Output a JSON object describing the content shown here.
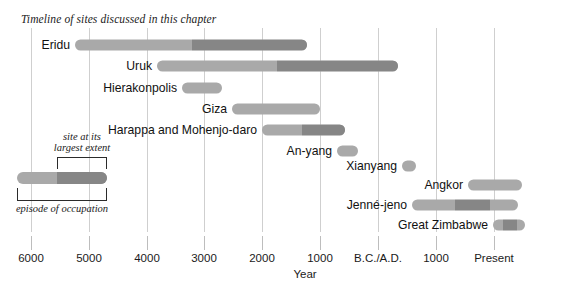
{
  "title": "Timeline of sites discussed in this chapter",
  "axis": {
    "label": "Year",
    "ticks": [
      {
        "text": "6000",
        "x": 31
      },
      {
        "text": "5000",
        "x": 89
      },
      {
        "text": "4000",
        "x": 147
      },
      {
        "text": "3000",
        "x": 204
      },
      {
        "text": "2000",
        "x": 262
      },
      {
        "text": "1000",
        "x": 320
      },
      {
        "text": "B.C./A.D.",
        "x": 378
      },
      {
        "text": "1000",
        "x": 436
      },
      {
        "text": "Present",
        "x": 494
      }
    ]
  },
  "colors": {
    "occupation": "#a9a9a9",
    "largest_extent": "#868686",
    "gridline": "#cfcfcf",
    "tick": "#bdbdbd",
    "text": "#111111",
    "bracket": "#2b2b2b"
  },
  "legend": {
    "upper_label_line1": "site at its",
    "upper_label_line2": "largest extent",
    "lower_label": "episode of occupation"
  },
  "chart_data": {
    "type": "bar",
    "orientation": "horizontal",
    "title": "Timeline of sites discussed in this chapter",
    "xlabel": "Year",
    "ylabel": "",
    "grid": true,
    "legend_position": "inside-left",
    "x_axis_ticks": [
      "6000",
      "5000",
      "4000",
      "3000",
      "2000",
      "1000",
      "B.C./A.D.",
      "1000",
      "Present"
    ],
    "x_axis_note": "Years B.C. decreasing left to right, then A.D. increasing to Present",
    "series_legend": [
      {
        "name": "episode of occupation",
        "color": "#a9a9a9"
      },
      {
        "name": "site at its largest extent",
        "color": "#868686"
      }
    ],
    "categories": [
      "Eridu",
      "Uruk",
      "Hierakonpolis",
      "Giza",
      "Harappa and Mohenjo-daro",
      "An-yang",
      "Xianyang",
      "Angkor",
      "Jenné-jeno",
      "Great Zimbabwe"
    ],
    "bars": [
      {
        "label": "Eridu",
        "row_y": 45,
        "label_x": 70,
        "occupation": {
          "start_px": 75,
          "end_px": 307
        },
        "largest_extent": {
          "start_px": 192,
          "end_px": 307
        }
      },
      {
        "label": "Uruk",
        "row_y": 66,
        "label_x": 152,
        "occupation": {
          "start_px": 157,
          "end_px": 398
        },
        "largest_extent": {
          "start_px": 277,
          "end_px": 398
        }
      },
      {
        "label": "Hierakonpolis",
        "row_y": 88,
        "label_x": 177,
        "occupation": {
          "start_px": 182,
          "end_px": 222
        },
        "largest_extent": null
      },
      {
        "label": "Giza",
        "row_y": 109,
        "label_x": 227,
        "occupation": {
          "start_px": 232,
          "end_px": 320
        },
        "largest_extent": null
      },
      {
        "label": "Harappa and Mohenjo-daro",
        "row_y": 130,
        "label_x": 257,
        "occupation": {
          "start_px": 262,
          "end_px": 345
        },
        "largest_extent": {
          "start_px": 302,
          "end_px": 345
        }
      },
      {
        "label": "An-yang",
        "row_y": 151,
        "label_x": 332,
        "occupation": {
          "start_px": 337,
          "end_px": 358
        },
        "largest_extent": null
      },
      {
        "label": "Xianyang",
        "row_y": 166,
        "label_x": 397,
        "occupation": {
          "start_px": 402,
          "end_px": 416
        },
        "largest_extent": null
      },
      {
        "label": "Angkor",
        "row_y": 185,
        "label_x": 463,
        "occupation": {
          "start_px": 468,
          "end_px": 522
        },
        "largest_extent": null
      },
      {
        "label": "Jenné-jeno",
        "row_y": 205,
        "label_x": 407,
        "occupation": {
          "start_px": 412,
          "end_px": 518
        },
        "largest_extent": {
          "start_px": 455,
          "end_px": 490
        }
      },
      {
        "label": "Great Zimbabwe",
        "row_y": 225,
        "label_x": 488,
        "occupation": {
          "start_px": 493,
          "end_px": 525
        },
        "largest_extent": {
          "start_px": 503,
          "end_px": 517
        }
      }
    ]
  }
}
